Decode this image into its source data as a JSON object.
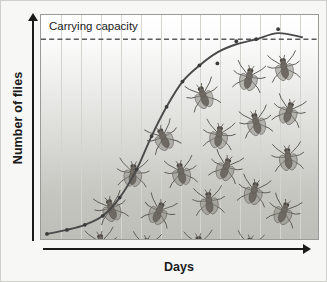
{
  "figure": {
    "kind": "logistic-growth-diagram"
  },
  "axes": {
    "y_label": "Number of flies",
    "x_label": "Days"
  },
  "annotations": {
    "carrying_capacity_label": "Carrying capacity"
  },
  "colors": {
    "curve": "#4a4a4a",
    "carrying_capacity_line": "#5a5a5a",
    "gridline": "#d4d4cf",
    "panel_border": "#9a9a96",
    "axis": "#1b1b1b",
    "text": "#1b1b1b",
    "shade_top": "#ffffff",
    "shade_bottom": "#bebeb8",
    "fly_body": "#6e6a63",
    "fly_wing": "#8d8a83",
    "outer_border": "#cfcfcb",
    "page_background": "#f7f7f6"
  },
  "chart_data": {
    "type": "line",
    "title": "",
    "xlabel": "Days",
    "ylabel": "Number of flies",
    "grid": "vertical",
    "legend": "none",
    "xlim": [
      0,
      14
    ],
    "ylim": [
      0,
      1.12
    ],
    "axis_ticks": "none",
    "annotations": [
      {
        "type": "hline",
        "label": "Carrying capacity",
        "value": 1.0,
        "style": "dashed"
      }
    ],
    "series": [
      {
        "name": "Fly population (logistic growth)",
        "style": "line-with-markers",
        "x": [
          0.3,
          1.3,
          2.2,
          3.1,
          3.95,
          4.8,
          5.55,
          6.3,
          7.1,
          7.95,
          8.85,
          9.8,
          10.8,
          11.9,
          13.1
        ],
        "y": [
          0.035,
          0.055,
          0.08,
          0.125,
          0.215,
          0.355,
          0.52,
          0.665,
          0.79,
          0.87,
          0.935,
          0.975,
          1.0,
          1.03,
          1.01
        ]
      }
    ],
    "scatter_points": {
      "name": "observed counts",
      "x": [
        0.3,
        1.3,
        2.2,
        3.1,
        3.95,
        4.8,
        5.55,
        6.3,
        7.1,
        7.95,
        8.85,
        9.8,
        10.8,
        11.9
      ],
      "y": [
        0.035,
        0.055,
        0.08,
        0.125,
        0.215,
        0.355,
        0.52,
        0.665,
        0.79,
        0.87,
        0.88,
        0.99,
        1.0,
        1.05
      ]
    },
    "gridlines_x": [
      1,
      2,
      3,
      4,
      5,
      6,
      7,
      8,
      9,
      10,
      11,
      12,
      13
    ]
  },
  "flies": [
    {
      "id": "fly-01",
      "x": 60,
      "y": 228,
      "rot": -8,
      "scale": 1.0
    },
    {
      "id": "fly-02",
      "x": 105,
      "y": 232,
      "rot": 6,
      "scale": 1.0
    },
    {
      "id": "fly-03",
      "x": 158,
      "y": 230,
      "rot": -4,
      "scale": 1.0
    },
    {
      "id": "fly-04",
      "x": 208,
      "y": 231,
      "rot": 10,
      "scale": 0.95
    },
    {
      "id": "fly-05",
      "x": 70,
      "y": 193,
      "rot": -18,
      "scale": 1.0
    },
    {
      "id": "fly-06",
      "x": 118,
      "y": 196,
      "rot": 22,
      "scale": 1.0
    },
    {
      "id": "fly-07",
      "x": 168,
      "y": 186,
      "rot": -6,
      "scale": 1.0
    },
    {
      "id": "fly-08",
      "x": 213,
      "y": 176,
      "rot": 14,
      "scale": 1.0
    },
    {
      "id": "fly-09",
      "x": 92,
      "y": 158,
      "rot": 4,
      "scale": 1.0
    },
    {
      "id": "fly-10",
      "x": 140,
      "y": 157,
      "rot": -12,
      "scale": 1.0
    },
    {
      "id": "fly-11",
      "x": 185,
      "y": 152,
      "rot": 18,
      "scale": 1.0
    },
    {
      "id": "fly-12",
      "x": 122,
      "y": 122,
      "rot": -24,
      "scale": 1.0
    },
    {
      "id": "fly-13",
      "x": 178,
      "y": 120,
      "rot": 8,
      "scale": 1.0
    },
    {
      "id": "fly-14",
      "x": 215,
      "y": 107,
      "rot": -14,
      "scale": 1.0
    },
    {
      "id": "fly-15",
      "x": 162,
      "y": 80,
      "rot": -20,
      "scale": 1.0
    },
    {
      "id": "fly-16",
      "x": 208,
      "y": 62,
      "rot": 12,
      "scale": 1.0
    },
    {
      "id": "fly-17",
      "x": 243,
      "y": 52,
      "rot": -10,
      "scale": 1.0
    },
    {
      "id": "fly-18",
      "x": 248,
      "y": 96,
      "rot": 16,
      "scale": 1.0
    },
    {
      "id": "fly-19",
      "x": 247,
      "y": 142,
      "rot": -6,
      "scale": 1.0
    },
    {
      "id": "fly-20",
      "x": 243,
      "y": 196,
      "rot": 20,
      "scale": 1.0
    }
  ]
}
